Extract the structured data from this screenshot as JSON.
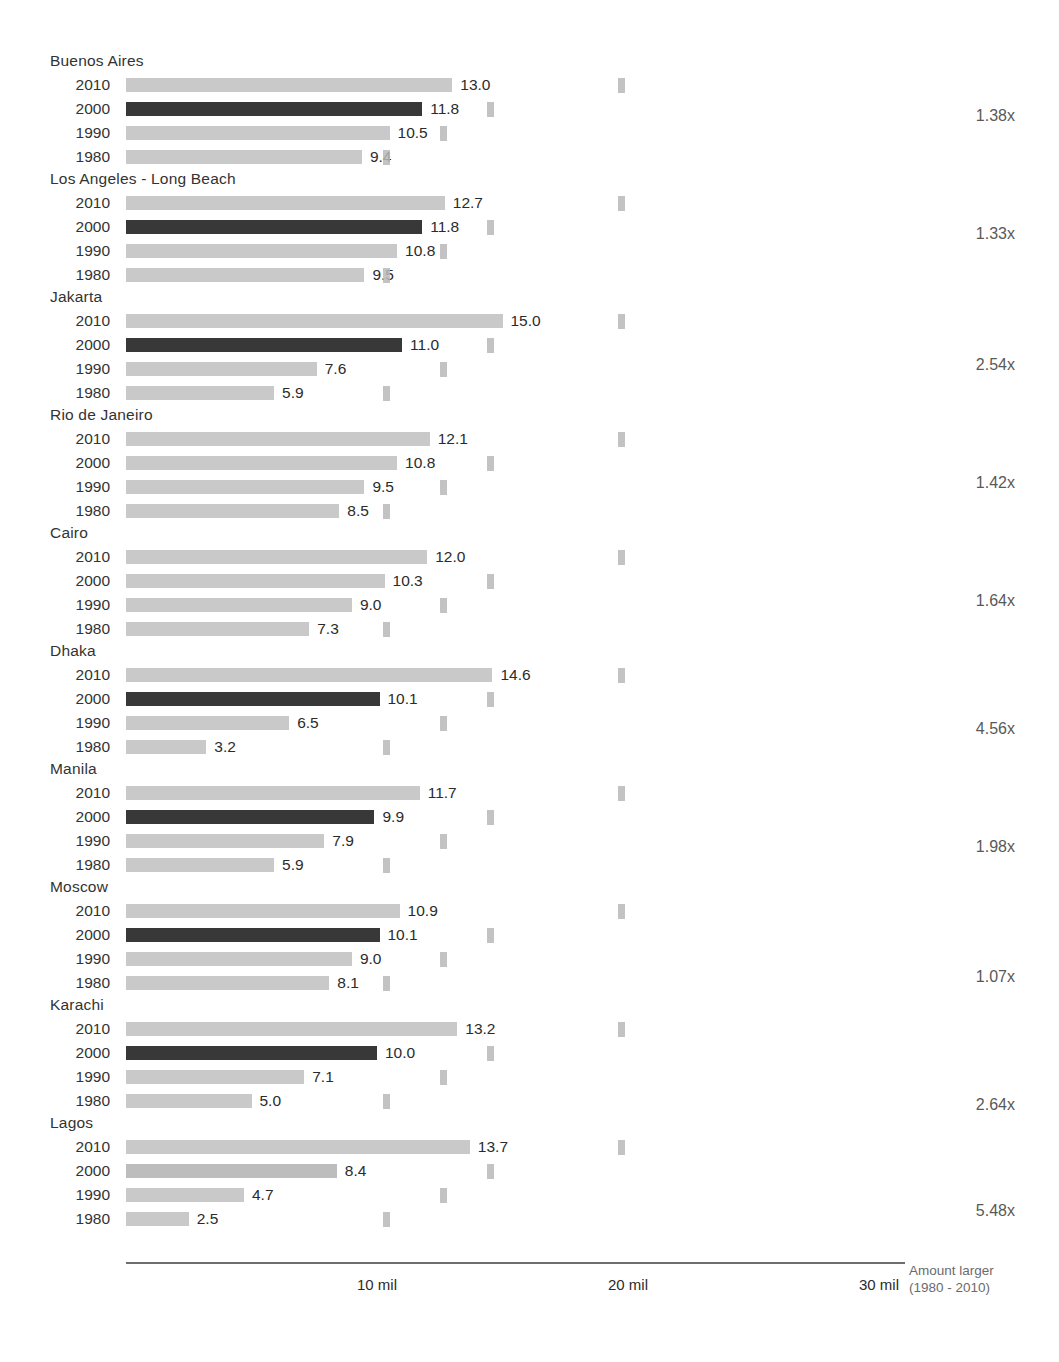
{
  "chart_data": {
    "type": "bar",
    "title": "",
    "xlabel": "",
    "ylabel": "",
    "orientation": "horizontal",
    "grid": false,
    "legend": "none",
    "xlim": [
      0,
      31
    ],
    "unit": "millions",
    "axis_ticks": [
      {
        "value": 10,
        "label": "10 mil"
      },
      {
        "value": 20,
        "label": "20 mil"
      },
      {
        "value": 30,
        "label": "30 mil"
      }
    ],
    "axis_note_line1": "Amount larger",
    "axis_note_line2": "(1980 - 2010)",
    "categories": [
      "2010",
      "2000",
      "1990",
      "1980"
    ],
    "series": [
      {
        "name": "Buenos Aires",
        "values": [
          13.0,
          11.8,
          10.5,
          9.4
        ],
        "labels": [
          "13.0",
          "11.8",
          "10.5",
          "9.4"
        ],
        "ratio": "1.38x",
        "highlight_index": 1
      },
      {
        "name": "Los Angeles - Long Beach",
        "values": [
          12.7,
          11.8,
          10.8,
          9.5
        ],
        "labels": [
          "12.7",
          "11.8",
          "10.8",
          "9.5"
        ],
        "ratio": "1.33x",
        "highlight_index": 1
      },
      {
        "name": "Jakarta",
        "values": [
          15.0,
          11.0,
          7.6,
          5.9
        ],
        "labels": [
          "15.0",
          "11.0",
          "7.6",
          "5.9"
        ],
        "ratio": "2.54x",
        "highlight_index": 1
      },
      {
        "name": "Rio de Janeiro",
        "values": [
          12.1,
          10.8,
          9.5,
          8.5
        ],
        "labels": [
          "12.1",
          "10.8",
          "9.5",
          "8.5"
        ],
        "ratio": "1.42x",
        "highlight_index": -1
      },
      {
        "name": "Cairo",
        "values": [
          12.0,
          10.3,
          9.0,
          7.3
        ],
        "labels": [
          "12.0",
          "10.3",
          "9.0",
          "7.3"
        ],
        "ratio": "1.64x",
        "highlight_index": -1
      },
      {
        "name": "Dhaka",
        "values": [
          14.6,
          10.1,
          6.5,
          3.2
        ],
        "labels": [
          "14.6",
          "10.1",
          "6.5",
          "3.2"
        ],
        "ratio": "4.56x",
        "highlight_index": 1
      },
      {
        "name": "Manila",
        "values": [
          11.7,
          9.9,
          7.9,
          5.9
        ],
        "labels": [
          "11.7",
          "9.9",
          "7.9",
          "5.9"
        ],
        "ratio": "1.98x",
        "highlight_index": 1
      },
      {
        "name": "Moscow",
        "values": [
          10.9,
          10.1,
          9.0,
          8.1
        ],
        "labels": [
          "10.9",
          "10.1",
          "9.0",
          "8.1"
        ],
        "ratio": "1.07x",
        "highlight_index": 1
      },
      {
        "name": "Karachi",
        "values": [
          13.2,
          10.0,
          7.1,
          5.0
        ],
        "labels": [
          "13.2",
          "10.0",
          "7.1",
          "5.0"
        ],
        "ratio": "2.64x",
        "highlight_index": 1
      },
      {
        "name": "Lagos",
        "values": [
          13.7,
          8.4,
          4.7,
          2.5
        ],
        "labels": [
          "13.7",
          "8.4",
          "4.7",
          "2.5"
        ],
        "ratio": "5.48x",
        "highlight_index": -1
      }
    ],
    "colors": {
      "bar_light": "#c9c9c9",
      "bar_highlight": "#383838",
      "bar_mid": "#bdbdbd",
      "text": "#2b2b2b",
      "ratio_text": "#595959",
      "axis": "#6e6e6e",
      "note_text": "#6b6b6b",
      "background": "#ffffff"
    }
  },
  "layout": {
    "bar_origin_x": 126,
    "px_per_million": 25.1,
    "group_top": 52,
    "group_height": 118,
    "row_height": 24,
    "rows_offset": 22,
    "artifact_x": [
      618,
      487,
      440,
      383
    ]
  }
}
